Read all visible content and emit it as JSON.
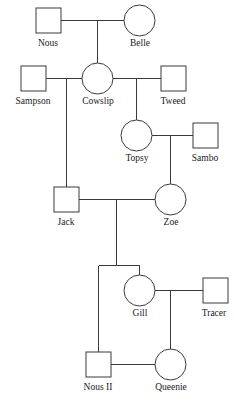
{
  "diagram": {
    "type": "pedigree",
    "background_color": "#ffffff",
    "line_color": "#3a3a3a",
    "text_color": "#1a1a1a",
    "shape_legend": {
      "square": "male",
      "circle": "female"
    }
  },
  "individuals": [
    {
      "id": "nous",
      "label": "Nous",
      "sex": "male",
      "shape": "square",
      "x": 48.5,
      "y": 20.5,
      "size": 25,
      "label_x": 48,
      "label_y": 46,
      "generation": 1
    },
    {
      "id": "belle",
      "label": "Belle",
      "sex": "female",
      "shape": "circle",
      "x": 139.5,
      "y": 20.5,
      "size": 31,
      "label_x": 140,
      "label_y": 46,
      "generation": 1
    },
    {
      "id": "sampson",
      "label": "Sampson",
      "sex": "male",
      "shape": "square",
      "x": 33.5,
      "y": 78.5,
      "size": 25,
      "label_x": 33,
      "label_y": 104,
      "generation": 2
    },
    {
      "id": "cowslip",
      "label": "Cowslip",
      "sex": "female",
      "shape": "circle",
      "x": 97.5,
      "y": 78.5,
      "size": 31,
      "label_x": 98,
      "label_y": 104,
      "generation": 2
    },
    {
      "id": "tweed",
      "label": "Tweed",
      "sex": "male",
      "shape": "square",
      "x": 173.5,
      "y": 78.5,
      "size": 25,
      "label_x": 173,
      "label_y": 104,
      "generation": 2
    },
    {
      "id": "topsy",
      "label": "Topsy",
      "sex": "female",
      "shape": "circle",
      "x": 136.5,
      "y": 135.5,
      "size": 31,
      "label_x": 137,
      "label_y": 161,
      "generation": 3
    },
    {
      "id": "sambo",
      "label": "Sambo",
      "sex": "male",
      "shape": "square",
      "x": 205.5,
      "y": 135.5,
      "size": 25,
      "label_x": 205,
      "label_y": 161,
      "generation": 3
    },
    {
      "id": "jack",
      "label": "Jack",
      "sex": "male",
      "shape": "square",
      "x": 66.5,
      "y": 199.5,
      "size": 25,
      "label_x": 66,
      "label_y": 225,
      "generation": 4
    },
    {
      "id": "zoe",
      "label": "Zoe",
      "sex": "female",
      "shape": "circle",
      "x": 170.5,
      "y": 199.5,
      "size": 31,
      "label_x": 171,
      "label_y": 225,
      "generation": 4
    },
    {
      "id": "gill",
      "label": "Gill",
      "sex": "female",
      "shape": "circle",
      "x": 139.5,
      "y": 290.5,
      "size": 31,
      "label_x": 140,
      "label_y": 316,
      "generation": 5
    },
    {
      "id": "tracer",
      "label": "Tracer",
      "sex": "male",
      "shape": "square",
      "x": 215.5,
      "y": 290.5,
      "size": 25,
      "label_x": 214,
      "label_y": 316,
      "generation": 5
    },
    {
      "id": "nous-ii",
      "label": "Nous II",
      "sex": "male",
      "shape": "square",
      "x": 98.5,
      "y": 364.5,
      "size": 25,
      "label_x": 98,
      "label_y": 390,
      "generation": 6
    },
    {
      "id": "queenie",
      "label": "Queenie",
      "sex": "female",
      "shape": "circle",
      "x": 170.5,
      "y": 364.5,
      "size": 31,
      "label_x": 171,
      "label_y": 390,
      "generation": 6
    }
  ],
  "unions": [
    {
      "id": "nous-belle",
      "partners": [
        "nous",
        "belle"
      ],
      "children": [
        "cowslip"
      ]
    },
    {
      "id": "sampson-cowslip",
      "partners": [
        "sampson",
        "cowslip"
      ],
      "children": [
        "jack"
      ]
    },
    {
      "id": "cowslip-tweed",
      "partners": [
        "cowslip",
        "tweed"
      ],
      "children": [
        "topsy"
      ]
    },
    {
      "id": "topsy-sambo",
      "partners": [
        "topsy",
        "sambo"
      ],
      "children": [
        "zoe"
      ]
    },
    {
      "id": "jack-zoe",
      "partners": [
        "jack",
        "zoe"
      ],
      "children": [
        "nous-ii",
        "gill"
      ]
    },
    {
      "id": "gill-tracer",
      "partners": [
        "gill",
        "tracer"
      ],
      "children": [
        "queenie"
      ]
    },
    {
      "id": "nousii-queenie",
      "partners": [
        "nous-ii",
        "queenie"
      ],
      "children": []
    }
  ],
  "edges": [
    {
      "id": "edge-nous-belle-bar",
      "name": "union-line-nous-belle",
      "d": "M 61 20.5 L 124 20.5"
    },
    {
      "id": "edge-nous-belle-drop",
      "name": "child-line-to-cowslip",
      "d": "M 97.5 20.5 L 97.5 63"
    },
    {
      "id": "edge-sampson-cowslip-bar",
      "name": "union-line-sampson-cowslip",
      "d": "M 46 78.5 L 82 78.5"
    },
    {
      "id": "edge-sampson-cowslip-drop",
      "name": "child-line-to-jack",
      "d": "M 66.5 78.5 L 66.5 187"
    },
    {
      "id": "edge-cowslip-tweed-bar",
      "name": "union-line-cowslip-tweed",
      "d": "M 113 78.5 L 161 78.5"
    },
    {
      "id": "edge-cowslip-tweed-drop",
      "name": "child-line-to-topsy",
      "d": "M 136.5 78.5 L 136.5 120"
    },
    {
      "id": "edge-topsy-sambo-bar",
      "name": "union-line-topsy-sambo",
      "d": "M 152 135.5 L 193 135.5"
    },
    {
      "id": "edge-topsy-sambo-drop",
      "name": "child-line-to-zoe",
      "d": "M 170.5 135.5 L 170.5 184"
    },
    {
      "id": "edge-jack-zoe-bar",
      "name": "union-line-jack-zoe",
      "d": "M 79 199.5 L 155 199.5"
    },
    {
      "id": "edge-jack-zoe-drop",
      "name": "sibship-drop-jack-zoe",
      "d": "M 116.5 199.5 L 116.5 265.5"
    },
    {
      "id": "edge-sibship-bar",
      "name": "sibship-bar-nousii-gill",
      "d": "M 98.5 265.5 L 139.5 265.5"
    },
    {
      "id": "edge-sib-left",
      "name": "child-line-to-nous-ii",
      "d": "M 98.5 265.5 L 98.5 352"
    },
    {
      "id": "edge-sib-right",
      "name": "child-line-to-gill",
      "d": "M 139.5 265.5 L 139.5 275"
    },
    {
      "id": "edge-gill-tracer-bar",
      "name": "union-line-gill-tracer",
      "d": "M 155 290.5 L 203 290.5"
    },
    {
      "id": "edge-gill-tracer-drop",
      "name": "child-line-to-queenie",
      "d": "M 170.5 290.5 L 170.5 349"
    },
    {
      "id": "edge-nousii-queenie-bar",
      "name": "union-line-nousii-queenie",
      "d": "M 111 364.5 L 155 364.5"
    }
  ]
}
